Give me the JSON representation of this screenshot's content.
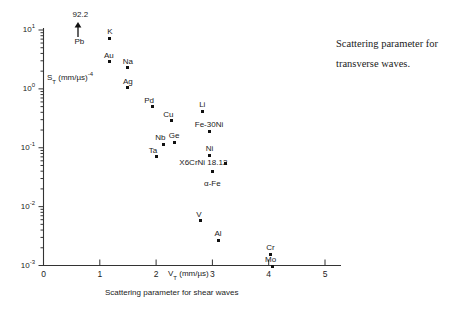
{
  "side_caption": {
    "line1": "Scattering parameter for",
    "line2": "transverse waves."
  },
  "axes": {
    "y_title": "S_T (mm/µs)^-4",
    "y_title_base": "S",
    "y_title_sub": "T",
    "y_title_unit": " (mm/µs)",
    "y_title_exp": "-4",
    "x_inline_title_base": "V",
    "x_inline_title_sub": "T",
    "x_inline_title_unit": " (mm/µs)",
    "x_caption": "Scattering parameter for shear waves",
    "y_tick_labels": [
      "10",
      "10",
      "10",
      "10",
      "10"
    ],
    "y_tick_exponents": [
      "1",
      "0",
      "-1",
      "-2",
      "-3"
    ],
    "x_tick_labels": [
      "0",
      "1",
      "2",
      "3",
      "4",
      "5"
    ]
  },
  "chart_data": {
    "type": "scatter",
    "title": "Scattering parameter for transverse waves.",
    "xlabel": "V_T (mm/µs)  — Scattering parameter for shear waves",
    "ylabel": "S_T (mm/µs)^-4",
    "xlim": [
      0,
      5
    ],
    "ylim": [
      0.001,
      10
    ],
    "yscale": "log",
    "xscale": "linear",
    "grid": false,
    "legend": false,
    "xticks": [
      0,
      1,
      2,
      3,
      4,
      5
    ],
    "yticks": [
      0.001,
      0.01,
      0.1,
      1,
      10
    ],
    "y_minor_ticks": true,
    "annotations": [
      {
        "label": "92.2",
        "x": 0.62,
        "y": 10.0,
        "note": "off-scale value for Pb, indicated by upward arrow"
      }
    ],
    "points": [
      {
        "name": "Pb",
        "x": 0.62,
        "y": 92.2,
        "off_scale": true,
        "label_dx": 0,
        "label_dy": 12
      },
      {
        "name": "K",
        "x": 1.18,
        "y": 7.3,
        "off_scale": false,
        "label_dx": 0,
        "label_dy": -8
      },
      {
        "name": "Au",
        "x": 1.18,
        "y": 2.9,
        "off_scale": false,
        "label_dx": -1,
        "label_dy": -8
      },
      {
        "name": "Na",
        "x": 1.5,
        "y": 2.3,
        "off_scale": false,
        "label_dx": 0,
        "label_dy": -8
      },
      {
        "name": "Ag",
        "x": 1.5,
        "y": 1.05,
        "off_scale": false,
        "label_dx": 0,
        "label_dy": -8
      },
      {
        "name": "Pd",
        "x": 1.93,
        "y": 0.5,
        "off_scale": false,
        "label_dx": -3,
        "label_dy": -8
      },
      {
        "name": "Cu",
        "x": 2.27,
        "y": 0.29,
        "off_scale": false,
        "label_dx": -3,
        "label_dy": -8
      },
      {
        "name": "Li",
        "x": 2.82,
        "y": 0.42,
        "off_scale": false,
        "label_dx": 0,
        "label_dy": -8
      },
      {
        "name": "Fe-30Ni",
        "x": 2.94,
        "y": 0.19,
        "off_scale": false,
        "label_dx": 0,
        "label_dy": -8
      },
      {
        "name": "Nb",
        "x": 2.13,
        "y": 0.115,
        "off_scale": false,
        "label_dx": -3,
        "label_dy": -8
      },
      {
        "name": "Ge",
        "x": 2.32,
        "y": 0.125,
        "off_scale": false,
        "label_dx": 0,
        "label_dy": -8
      },
      {
        "name": "Ta",
        "x": 2.0,
        "y": 0.07,
        "off_scale": false,
        "label_dx": -3,
        "label_dy": -8
      },
      {
        "name": "Ni",
        "x": 2.95,
        "y": 0.075,
        "off_scale": false,
        "label_dx": 0,
        "label_dy": -8
      },
      {
        "name": "X6CrNi 18.12",
        "x": 3.23,
        "y": 0.053,
        "off_scale": false,
        "label_dx": -30,
        "label_dy": -2
      },
      {
        "name": "α-Fe",
        "x": 3.0,
        "y": 0.04,
        "off_scale": false,
        "label_dx": 0,
        "label_dy": 11
      },
      {
        "name": "V",
        "x": 2.78,
        "y": 0.0057,
        "off_scale": false,
        "label_dx": -1,
        "label_dy": -8
      },
      {
        "name": "Al",
        "x": 3.1,
        "y": 0.0027,
        "off_scale": false,
        "label_dx": 0,
        "label_dy": -8
      },
      {
        "name": "Cr",
        "x": 4.03,
        "y": 0.00155,
        "off_scale": false,
        "label_dx": 0,
        "label_dy": -8
      },
      {
        "name": "Mo",
        "x": 4.07,
        "y": 0.00098,
        "off_scale": false,
        "label_dx": -2,
        "label_dy": -8
      }
    ]
  }
}
